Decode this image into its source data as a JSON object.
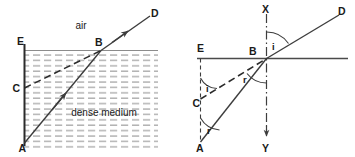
{
  "figure": {
    "background_color": "#ffffff",
    "stroke_color": "#3d3d3d",
    "text_color": "#1a1a1a"
  },
  "left_diagram": {
    "medium_label_air": "air",
    "medium_label_dense": "dense medium",
    "points": {
      "A": "A",
      "B": "B",
      "C": "C",
      "D": "D",
      "E": "E"
    }
  },
  "right_diagram": {
    "points": {
      "A": "A",
      "B": "B",
      "C": "C",
      "D": "D",
      "E": "E",
      "X": "X",
      "Y": "Y"
    },
    "angles": {
      "incidence_at_b": "i",
      "incidence_at_c": "i",
      "refraction_at_b": "r",
      "refraction_at_a": "r"
    }
  }
}
